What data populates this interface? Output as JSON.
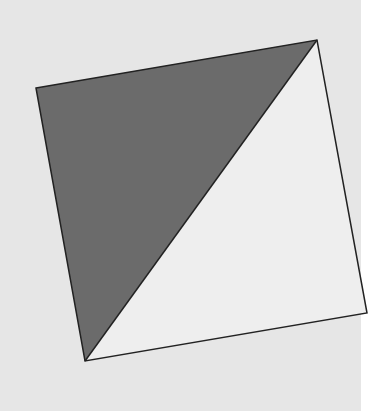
{
  "figure": {
    "background_color": "#e6e6e6",
    "right_strip_color": "#ffffff",
    "background_width": 361,
    "stroke_color": "#222222",
    "square": {
      "vertices": {
        "top_left": [
          36,
          88
        ],
        "top_right": [
          317,
          40
        ],
        "bottom_right": [
          367,
          313
        ],
        "bottom_left": [
          85,
          361
        ]
      },
      "diagonal": "bottom_left to top_right"
    },
    "regions": [
      {
        "name": "upper-left-triangle",
        "fill": "#6b6b6b",
        "points": "36,88 317,40 85,361"
      },
      {
        "name": "lower-right-triangle",
        "fill": "#eeeeee",
        "points": "317,40 367,313 85,361"
      }
    ]
  }
}
